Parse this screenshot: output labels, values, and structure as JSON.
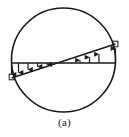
{
  "figure": {
    "caption": "(a)",
    "title": "",
    "kind": "circular-cross-section-stress-distribution",
    "colors": {
      "stroke": "#1a1a1a",
      "background": "#ffffff",
      "arrow": "#1a1a1a"
    },
    "circle": {
      "center_x": 63.5,
      "center_y": 60,
      "radius": 52,
      "stroke_width": 1.6
    },
    "reference_line": {
      "label": "horizontal-datum",
      "x1": 11.5,
      "y1": 63,
      "x2": 115.5,
      "y2": 63,
      "stroke_width": 1.3
    },
    "distribution_line": {
      "label": "linear-stress-distribution",
      "x1": 11.5,
      "y1": 78,
      "x2": 115.5,
      "y2": 44,
      "stroke_width": 1.4
    },
    "neutral_axis_x": 63.5,
    "arrows_down": [
      {
        "x": 18.5,
        "y_top": 63,
        "y_bottom": 76.1
      },
      {
        "x": 28.0,
        "y_top": 63,
        "y_bottom": 73.0
      },
      {
        "x": 37.5,
        "y_top": 63,
        "y_bottom": 69.9
      },
      {
        "x": 47.0,
        "y_top": 63,
        "y_bottom": 66.8
      }
    ],
    "arrows_up": [
      {
        "x": 80.0,
        "y_bottom": 63,
        "y_top": 57.6
      },
      {
        "x": 89.5,
        "y_bottom": 63,
        "y_top": 54.5
      },
      {
        "x": 99.0,
        "y_bottom": 63,
        "y_top": 51.4
      }
    ],
    "end_arrow_left": {
      "x": 11.5,
      "y_top": 63,
      "y_bottom": 78
    },
    "end_arrow_right": {
      "x": 115.5,
      "y_bottom": 63,
      "y_top": 44
    },
    "end_cap_left": {
      "x": 9.5,
      "y": 74,
      "w": 5,
      "h": 6
    },
    "end_cap_right": {
      "x": 113,
      "y": 41,
      "w": 5,
      "h": 6
    }
  }
}
